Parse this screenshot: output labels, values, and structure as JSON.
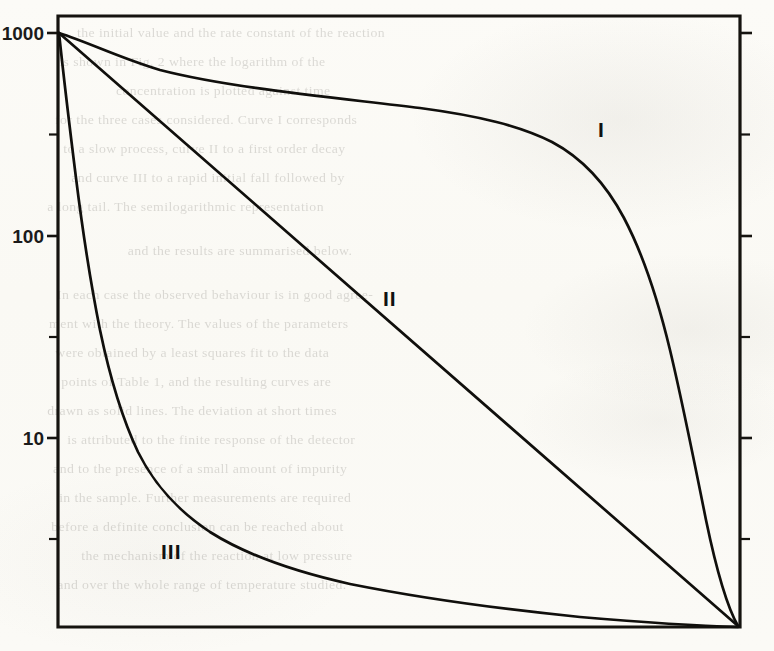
{
  "figure": {
    "kind": "semilog-line-plot",
    "background_color": "#fbfaf6",
    "ink_color": "#15130f"
  },
  "axis": {
    "y_labels": [
      "1000",
      "100",
      "10"
    ],
    "y_label_1000": "1000",
    "y_label_100": "100",
    "y_label_10": "10"
  },
  "curve_labels": {
    "one": "I",
    "two": "II",
    "three": "III"
  },
  "ghost_lines": [
    {
      "x": 80,
      "y": 18,
      "text": "the initial value and the rate constant of the reaction"
    },
    {
      "x": 62,
      "y": 47,
      "text": "is shown in Fig. 2 where the logarithm of the"
    },
    {
      "x": 118,
      "y": 76,
      "text": "concentration is plotted against time"
    },
    {
      "x": 58,
      "y": 105,
      "text": "for the three cases considered. Curve I corresponds"
    },
    {
      "x": 66,
      "y": 134,
      "text": "to a slow process, curve II to a first order decay"
    },
    {
      "x": 74,
      "y": 163,
      "text": "and curve III to a rapid initial fall followed by"
    },
    {
      "x": 50,
      "y": 192,
      "text": "a long tail. The semilogarithmic representation"
    },
    {
      "x": 130,
      "y": 236,
      "text": "and the results are summarised below."
    },
    {
      "x": 60,
      "y": 280,
      "text": "In each case the observed behaviour is in good agree-"
    },
    {
      "x": 52,
      "y": 309,
      "text": "ment with the theory. The values of the parameters"
    },
    {
      "x": 58,
      "y": 338,
      "text": "were obtained by a least squares fit to the data"
    },
    {
      "x": 64,
      "y": 367,
      "text": "points of Table 1, and the resulting curves are"
    },
    {
      "x": 50,
      "y": 396,
      "text": "drawn as solid lines. The deviation at short times"
    },
    {
      "x": 70,
      "y": 425,
      "text": "is attributed to the finite response of the detector"
    },
    {
      "x": 56,
      "y": 454,
      "text": "and to the presence of a small amount of impurity"
    },
    {
      "x": 62,
      "y": 483,
      "text": "in the sample. Further measurements are required"
    },
    {
      "x": 54,
      "y": 512,
      "text": "before a definite conclusion can be reached about"
    },
    {
      "x": 84,
      "y": 541,
      "text": "the mechanism of the reaction at low pressure"
    },
    {
      "x": 60,
      "y": 570,
      "text": "and over the whole range of temperature studied."
    }
  ],
  "chart_data": {
    "type": "line",
    "title": "",
    "xlabel": "",
    "ylabel": "",
    "yscale": "log",
    "ylim": [
      1,
      1000
    ],
    "y_ticks_major": [
      1000,
      100,
      10
    ],
    "y_ticks_minor_decades": 3,
    "xlim": [
      0,
      1
    ],
    "grid": false,
    "legend": "inline-curve-labels",
    "series": [
      {
        "name": "I",
        "label": "I",
        "label_position": {
          "x": 0.79,
          "y": 390
        },
        "description": "stays near 1000 across most of x, then falls steeply to the baseline at x=1",
        "x": [
          0.0,
          0.03,
          0.07,
          0.12,
          0.2,
          0.3,
          0.4,
          0.5,
          0.58,
          0.65,
          0.72,
          0.78,
          0.83,
          0.88,
          0.92,
          0.95,
          0.975,
          0.99,
          1.0
        ],
        "y": [
          1000,
          900,
          830,
          790,
          760,
          730,
          700,
          660,
          620,
          560,
          470,
          370,
          270,
          170,
          95,
          45,
          18,
          5,
          1
        ]
      },
      {
        "name": "II",
        "label": "II",
        "label_position": {
          "x": 0.47,
          "y": 55
        },
        "description": "straight line on the semilog axis: pure exponential decay from 1000 to the baseline",
        "x": [
          0.0,
          0.1,
          0.2,
          0.3,
          0.4,
          0.5,
          0.6,
          0.7,
          0.8,
          0.9,
          1.0
        ],
        "y": [
          1000,
          501,
          251,
          126,
          63,
          32,
          16,
          7.9,
          4.0,
          2.0,
          1.0
        ]
      },
      {
        "name": "III",
        "label": "III",
        "label_position": {
          "x": 0.175,
          "y": 3.1
        },
        "description": "very rapid initial fall from 1000 then a long flat tail just above the baseline",
        "x": [
          0.0,
          0.01,
          0.02,
          0.035,
          0.05,
          0.07,
          0.09,
          0.12,
          0.16,
          0.22,
          0.3,
          0.4,
          0.55,
          0.7,
          0.85,
          0.95,
          1.0
        ],
        "y": [
          1000,
          420,
          180,
          72,
          34,
          17,
          10.5,
          6.4,
          4.3,
          3.1,
          2.45,
          2.05,
          1.75,
          1.55,
          1.35,
          1.15,
          1.0
        ]
      }
    ]
  }
}
